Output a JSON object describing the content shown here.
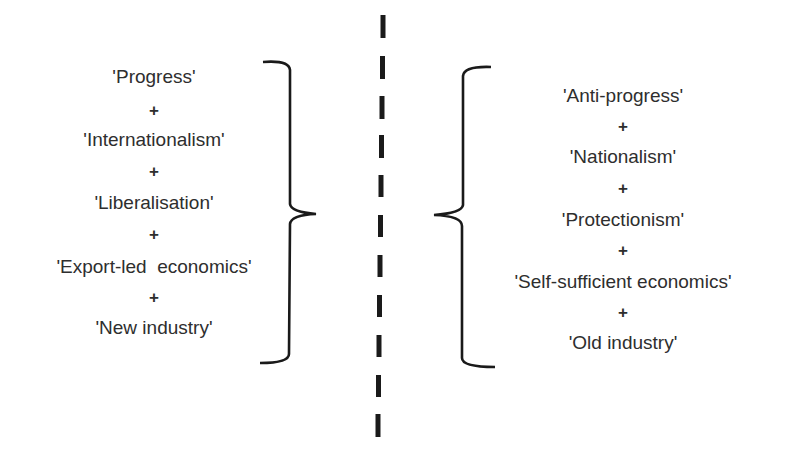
{
  "diagram": {
    "left_group": {
      "items": [
        "'Progress'",
        "'Internationalism'",
        "'Liberalisation'",
        "'Export-led  economics'",
        "'New industry'"
      ],
      "connector": "+"
    },
    "right_group": {
      "items": [
        "'Anti-progress'",
        "'Nationalism'",
        "'Protectionism'",
        "'Self-sufficient economics'",
        "'Old industry'"
      ],
      "connector": "+"
    },
    "divider": "dashed-vertical-line",
    "colors": {
      "text": "#2e2e2e",
      "lines": "#1a1a1a",
      "background": "#ffffff"
    }
  }
}
